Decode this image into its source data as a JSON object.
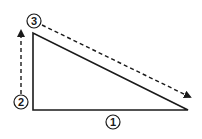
{
  "diagram": {
    "type": "right-triangle-with-steps",
    "colors": {
      "background": "#ffffff",
      "stroke": "#1a1a1a"
    },
    "triangle": {
      "vertices": {
        "top_left": [
          33,
          33
        ],
        "bottom_left": [
          33,
          110
        ],
        "bottom_right": [
          188,
          110
        ]
      }
    },
    "labels": [
      {
        "id": "1",
        "text": "1",
        "cx": 113,
        "cy": 122,
        "meaning": "bottom edge"
      },
      {
        "id": "2",
        "text": "2",
        "cx": 21,
        "cy": 102,
        "meaning": "vertical edge start"
      },
      {
        "id": "3",
        "text": "3",
        "cx": 34,
        "cy": 21,
        "meaning": "hypotenuse start"
      }
    ],
    "arrows": [
      {
        "id": "arrow-2",
        "style": "dashed",
        "from": [
          21,
          94
        ],
        "to": [
          21,
          30
        ]
      },
      {
        "id": "arrow-3",
        "style": "dashed",
        "from": [
          42,
          25
        ],
        "to": [
          191,
          98
        ]
      }
    ]
  }
}
